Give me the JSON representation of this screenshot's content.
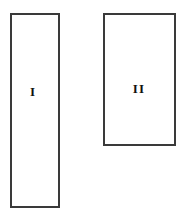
{
  "figure": {
    "background_color": "#ffffff",
    "width": 184,
    "height": 221,
    "shapes": [
      {
        "id": "rectangle-one",
        "label": "I",
        "shape": "rectangle",
        "x": 10,
        "y": 13,
        "width": 50,
        "height": 195,
        "border_width": 2,
        "border_color": "#3a3a3a",
        "fill_color": "#ffffff",
        "label_color": "#111111",
        "label_font_size": 13,
        "label_x": 33,
        "label_y": 91
      },
      {
        "id": "rectangle-two",
        "label": "II",
        "shape": "rectangle",
        "x": 103,
        "y": 13,
        "width": 73,
        "height": 133,
        "border_width": 2,
        "border_color": "#3a3a3a",
        "fill_color": "#ffffff",
        "label_color": "#111111",
        "label_font_size": 13,
        "label_x": 139,
        "label_y": 88
      }
    ]
  }
}
